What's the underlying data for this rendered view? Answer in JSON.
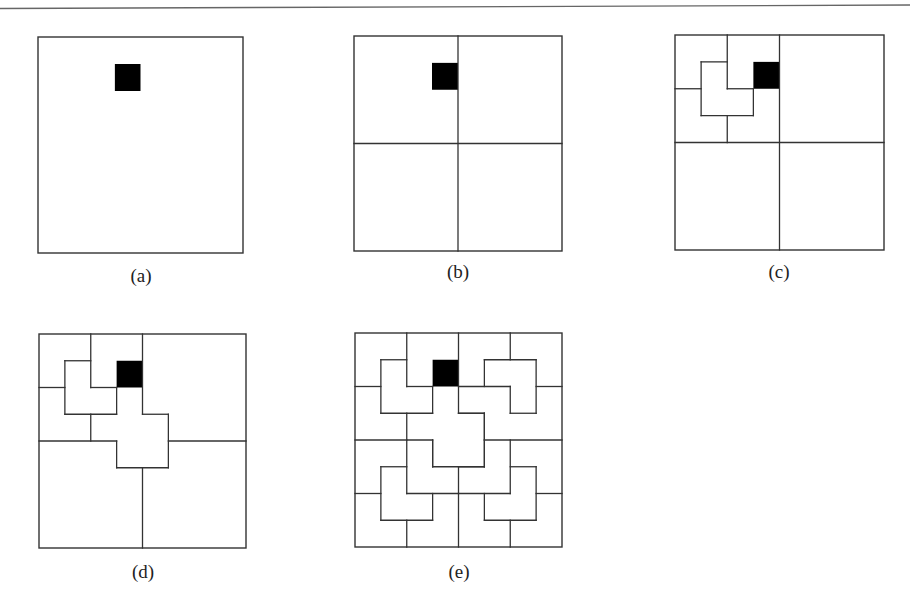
{
  "figure": {
    "grid_size": 8,
    "line_color": "#333333",
    "fill_color": "#000000",
    "defect_cell": {
      "row": 1,
      "col": 3
    },
    "panels": [
      {
        "id": "a",
        "caption": "(a)",
        "bounds": {
          "left": 38,
          "top": 37,
          "right": 243,
          "bottom": 253
        },
        "caption_pos": {
          "x": 141,
          "y": 276
        },
        "segments": []
      },
      {
        "id": "b",
        "caption": "(b)",
        "bounds": {
          "left": 354,
          "top": 36,
          "right": 562,
          "bottom": 251
        },
        "caption_pos": {
          "x": 458,
          "y": 272
        },
        "segments": [
          [
            4,
            0,
            4,
            8
          ],
          [
            0,
            4,
            8,
            4
          ]
        ]
      },
      {
        "id": "c",
        "caption": "(c)",
        "bounds": {
          "left": 675,
          "top": 35,
          "right": 884,
          "bottom": 250
        },
        "caption_pos": {
          "x": 779,
          "y": 272
        },
        "segments": [
          [
            4,
            0,
            4,
            8
          ],
          [
            0,
            4,
            8,
            4
          ],
          [
            2,
            0,
            2,
            2
          ],
          [
            0,
            2,
            1,
            2
          ],
          [
            1,
            1,
            2,
            1
          ],
          [
            1,
            1,
            1,
            3
          ],
          [
            2,
            2,
            3,
            2
          ],
          [
            3,
            2,
            3,
            3
          ],
          [
            1,
            3,
            3,
            3
          ],
          [
            2,
            3,
            2,
            4
          ]
        ]
      },
      {
        "id": "d",
        "caption": "(d)",
        "bounds": {
          "left": 39,
          "top": 334,
          "right": 246,
          "bottom": 548
        },
        "caption_pos": {
          "x": 143,
          "y": 572
        },
        "segments": [
          [
            4,
            0,
            4,
            3
          ],
          [
            0,
            4,
            3,
            4
          ],
          [
            4,
            3,
            5,
            3
          ],
          [
            5,
            3,
            5,
            5
          ],
          [
            3,
            5,
            5,
            5
          ],
          [
            3,
            4,
            3,
            5
          ],
          [
            5,
            4,
            8,
            4
          ],
          [
            4,
            5,
            4,
            8
          ],
          [
            2,
            0,
            2,
            2
          ],
          [
            0,
            2,
            1,
            2
          ],
          [
            1,
            1,
            2,
            1
          ],
          [
            1,
            1,
            1,
            3
          ],
          [
            2,
            2,
            3,
            2
          ],
          [
            3,
            2,
            3,
            3
          ],
          [
            1,
            3,
            3,
            3
          ],
          [
            2,
            3,
            2,
            4
          ]
        ]
      },
      {
        "id": "e",
        "caption": "(e)",
        "bounds": {
          "left": 355,
          "top": 333,
          "right": 562,
          "bottom": 547
        },
        "caption_pos": {
          "x": 459,
          "y": 572
        },
        "segments": [
          [
            4,
            0,
            4,
            3
          ],
          [
            0,
            4,
            3,
            4
          ],
          [
            4,
            3,
            5,
            3
          ],
          [
            5,
            3,
            5,
            5
          ],
          [
            3,
            5,
            5,
            5
          ],
          [
            3,
            4,
            3,
            5
          ],
          [
            5,
            4,
            8,
            4
          ],
          [
            4,
            5,
            4,
            8
          ],
          [
            2,
            0,
            2,
            2
          ],
          [
            0,
            2,
            1,
            2
          ],
          [
            1,
            1,
            2,
            1
          ],
          [
            1,
            1,
            1,
            3
          ],
          [
            2,
            2,
            3,
            2
          ],
          [
            3,
            2,
            3,
            3
          ],
          [
            1,
            3,
            3,
            3
          ],
          [
            2,
            3,
            2,
            4
          ],
          [
            6,
            0,
            6,
            1
          ],
          [
            5,
            1,
            7,
            1
          ],
          [
            5,
            1,
            5,
            2
          ],
          [
            4,
            2,
            6,
            2
          ],
          [
            6,
            2,
            6,
            3
          ],
          [
            6,
            3,
            7,
            3
          ],
          [
            7,
            1,
            7,
            3
          ],
          [
            7,
            2,
            8,
            2
          ],
          [
            4,
            3,
            5,
            3
          ],
          [
            5,
            3,
            5,
            4
          ],
          [
            2,
            4,
            2,
            6
          ],
          [
            3,
            4,
            3,
            5
          ],
          [
            1,
            5,
            2,
            5
          ],
          [
            1,
            5,
            1,
            7
          ],
          [
            0,
            6,
            1,
            6
          ],
          [
            2,
            6,
            4,
            6
          ],
          [
            3,
            6,
            3,
            7
          ],
          [
            1,
            7,
            3,
            7
          ],
          [
            2,
            7,
            2,
            8
          ],
          [
            5,
            4,
            5,
            5
          ],
          [
            4,
            5,
            5,
            5
          ],
          [
            6,
            4,
            6,
            6
          ],
          [
            6,
            5,
            7,
            5
          ],
          [
            7,
            5,
            7,
            7
          ],
          [
            7,
            6,
            8,
            6
          ],
          [
            4,
            6,
            6,
            6
          ],
          [
            5,
            6,
            5,
            7
          ],
          [
            5,
            7,
            7,
            7
          ],
          [
            6,
            7,
            6,
            8
          ]
        ]
      }
    ],
    "trominoes_final": [
      [
        [
          0,
          0
        ],
        [
          0,
          1
        ],
        [
          1,
          0
        ]
      ],
      [
        [
          0,
          2
        ],
        [
          0,
          3
        ],
        [
          1,
          2
        ]
      ],
      [
        [
          1,
          1
        ],
        [
          2,
          1
        ],
        [
          2,
          2
        ]
      ],
      [
        [
          2,
          0
        ],
        [
          3,
          0
        ],
        [
          3,
          1
        ]
      ],
      [
        [
          2,
          3
        ],
        [
          3,
          2
        ],
        [
          3,
          3
        ]
      ],
      [
        [
          0,
          4
        ],
        [
          0,
          5
        ],
        [
          1,
          4
        ]
      ],
      [
        [
          0,
          6
        ],
        [
          0,
          7
        ],
        [
          1,
          7
        ]
      ],
      [
        [
          1,
          5
        ],
        [
          1,
          6
        ],
        [
          2,
          6
        ]
      ],
      [
        [
          2,
          4
        ],
        [
          2,
          5
        ],
        [
          3,
          5
        ]
      ],
      [
        [
          2,
          7
        ],
        [
          3,
          6
        ],
        [
          3,
          7
        ]
      ],
      [
        [
          3,
          4
        ],
        [
          4,
          3
        ],
        [
          4,
          4
        ]
      ],
      [
        [
          4,
          0
        ],
        [
          4,
          1
        ],
        [
          5,
          0
        ]
      ],
      [
        [
          4,
          2
        ],
        [
          5,
          2
        ],
        [
          5,
          3
        ]
      ],
      [
        [
          5,
          1
        ],
        [
          6,
          1
        ],
        [
          6,
          2
        ]
      ],
      [
        [
          6,
          0
        ],
        [
          7,
          0
        ],
        [
          7,
          1
        ]
      ],
      [
        [
          6,
          3
        ],
        [
          7,
          2
        ],
        [
          7,
          3
        ]
      ],
      [
        [
          4,
          5
        ],
        [
          5,
          4
        ],
        [
          5,
          5
        ]
      ],
      [
        [
          4,
          6
        ],
        [
          4,
          7
        ],
        [
          5,
          7
        ]
      ],
      [
        [
          5,
          6
        ],
        [
          6,
          5
        ],
        [
          6,
          6
        ]
      ],
      [
        [
          6,
          4
        ],
        [
          7,
          4
        ],
        [
          7,
          5
        ]
      ],
      [
        [
          6,
          7
        ],
        [
          7,
          6
        ],
        [
          7,
          7
        ]
      ]
    ]
  }
}
